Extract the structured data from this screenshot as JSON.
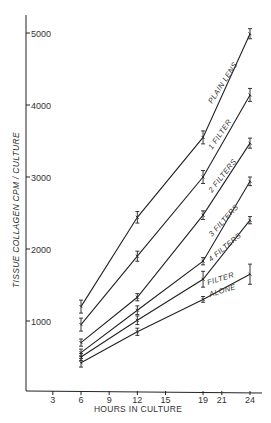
{
  "chart_data": {
    "type": "line",
    "title": "",
    "xlabel": "HOURS IN CULTURE",
    "ylabel": "TISSUE COLLAGEN CPM / CULTURE",
    "x_ticks": [
      3,
      6,
      9,
      12,
      15,
      19,
      21,
      24
    ],
    "y_ticks": [
      1000,
      2000,
      3000,
      4000,
      5000
    ],
    "xlim": [
      0,
      25
    ],
    "ylim": [
      0,
      5400
    ],
    "grid": false,
    "legend": "inline labels along lines",
    "x": [
      6,
      12,
      19,
      24
    ],
    "series": [
      {
        "name": "PLAIN LENS",
        "values": [
          1200,
          2440,
          3550,
          4990
        ],
        "error": [
          90,
          80,
          90,
          70
        ]
      },
      {
        "name": "1 FILTER",
        "values": [
          950,
          1900,
          3000,
          4140
        ],
        "error": [
          90,
          70,
          90,
          90
        ]
      },
      {
        "name": "2 FILTERS",
        "values": [
          700,
          1330,
          2470,
          3470
        ],
        "error": [
          50,
          50,
          60,
          70
        ]
      },
      {
        "name": "3 FILTERS",
        "values": [
          560,
          1150,
          1830,
          2940
        ],
        "error": [
          50,
          60,
          50,
          60
        ]
      },
      {
        "name": "4 FILTERS",
        "values": [
          500,
          1010,
          1580,
          2400
        ],
        "error": [
          50,
          60,
          110,
          50
        ]
      },
      {
        "name": "FILTER ALONE",
        "values": [
          420,
          850,
          1300,
          1650
        ],
        "error": [
          60,
          50,
          40,
          140
        ]
      }
    ]
  },
  "labels": {
    "xlabel": "HOURS IN CULTURE",
    "ylabel": "TISSUE  COLLAGEN  CPM / CULTURE",
    "series": {
      "plain_lens": "PLAIN LENS",
      "one_filter": "1 FILTER",
      "two_filters": "2 FILTERS",
      "three_filters": "3 FILTERS",
      "four_filters": "4 FILTERS",
      "filter_alone_1": "FILTER",
      "filter_alone_2": "ALONE"
    }
  }
}
